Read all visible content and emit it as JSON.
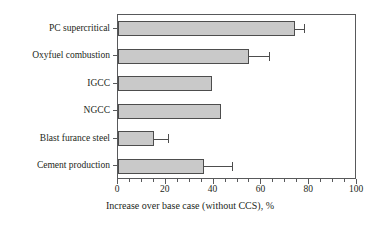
{
  "chart_data": {
    "type": "bar",
    "orientation": "horizontal",
    "title": "",
    "xlabel": "Increase over base case (without CCS), %",
    "ylabel": "",
    "xlim": [
      0,
      100
    ],
    "xticks": [
      0,
      20,
      40,
      60,
      80,
      100
    ],
    "xtick_labels": [
      "0",
      "20",
      "40",
      "60",
      "80",
      "100"
    ],
    "minor_tick_step": 5,
    "grid": false,
    "legend": null,
    "bar_fill_color": "#c9c9c9",
    "bar_edge_color": "#4d4d4d",
    "frame_color": "#58595b",
    "background_color": "#ffffff",
    "categories": [
      "PC supercritical",
      "Oxyfuel combustion",
      "IGCC",
      "NGCC",
      "Blast furance steel",
      "Cement production"
    ],
    "values": [
      74,
      55,
      39.5,
      43,
      15,
      36
    ],
    "error_high": [
      78,
      63,
      null,
      null,
      21,
      47.5
    ],
    "points": [
      {
        "category": "PC supercritical",
        "value": 74,
        "error_high": 78,
        "has_error_bar": true
      },
      {
        "category": "Oxyfuel combustion",
        "value": 55,
        "error_high": 63,
        "has_error_bar": true
      },
      {
        "category": "IGCC",
        "value": 39.5,
        "error_high": null,
        "has_error_bar": false
      },
      {
        "category": "NGCC",
        "value": 43,
        "error_high": null,
        "has_error_bar": false
      },
      {
        "category": "Blast furance steel",
        "value": 15,
        "error_high": 21,
        "has_error_bar": true
      },
      {
        "category": "Cement production",
        "value": 36,
        "error_high": 47.5,
        "has_error_bar": true
      }
    ]
  }
}
